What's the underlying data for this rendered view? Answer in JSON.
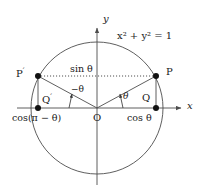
{
  "figure": {
    "equation": "x² + y² = 1",
    "axes": {
      "x_label": "x",
      "y_label": "y",
      "origin_label": "O"
    },
    "points": [
      {
        "key": "P",
        "label": "P",
        "prime": ""
      },
      {
        "key": "Pprime",
        "label": "P",
        "prime": "′"
      },
      {
        "key": "Q",
        "label": "Q",
        "prime": ""
      },
      {
        "key": "Qprime",
        "label": "Q",
        "prime": "′"
      }
    ],
    "labels": {
      "sin_theta": "sin θ",
      "cos_theta": "cos θ",
      "cos_pi_minus_theta": "cos(π − θ)",
      "angle_theta": "θ",
      "angle_minus_theta": "−θ"
    },
    "colors": {
      "stroke": "#4d4d4d",
      "text": "#1a1a1a",
      "dot": "#111111",
      "background": "#ffffff"
    },
    "geometry": {
      "center_x": 97,
      "center_y": 108,
      "radius": 66,
      "point_p_x": 156,
      "point_p_y": 76,
      "point_pprime_x": 38,
      "point_pprime_y": 76
    }
  }
}
